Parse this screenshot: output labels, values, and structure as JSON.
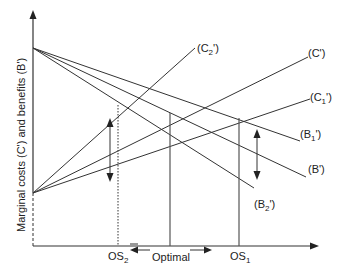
{
  "diagram": {
    "y_axis_label": "Marginal costs (C') and benefits (B')",
    "curves": {
      "benefits": [
        {
          "id": "B1",
          "label": "(B",
          "sub": "1",
          "suffix": "')"
        },
        {
          "id": "B",
          "label": "(B')"
        },
        {
          "id": "B2",
          "label": "(B",
          "sub": "2",
          "suffix": "')"
        }
      ],
      "costs": [
        {
          "id": "C2",
          "label": "(C",
          "sub": "2",
          "suffix": "')"
        },
        {
          "id": "C",
          "label": "(C')"
        },
        {
          "id": "C1",
          "label": "(C",
          "sub": "1",
          "suffix": "')"
        }
      ]
    },
    "x_ticks": {
      "os2": {
        "label": "OS",
        "sub": "2"
      },
      "os1": {
        "label": "OS",
        "sub": "1"
      }
    },
    "optimal_label_line1": "Optimal",
    "optimal_label_line2": "size",
    "line_color": "#333333"
  }
}
